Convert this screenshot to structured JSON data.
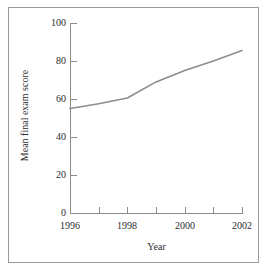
{
  "chart_data": {
    "type": "line",
    "title": "",
    "xlabel": "Year",
    "ylabel": "Mean final exam score",
    "x": [
      1996,
      1997,
      1998,
      1999,
      2000,
      2001,
      2002
    ],
    "series": [
      {
        "name": "Mean final exam score",
        "values": [
          55,
          57.5,
          60.5,
          69,
          75,
          80,
          85.5
        ],
        "color": "#8c8c8c"
      }
    ],
    "xlim": [
      1996,
      2002
    ],
    "ylim": [
      0,
      100
    ],
    "xticks": [
      1996,
      1997,
      1998,
      1999,
      2000,
      2001,
      2002
    ],
    "xtick_labels": [
      "1996",
      "",
      "1998",
      "",
      "2000",
      "",
      "2002"
    ],
    "yticks": [
      0,
      20,
      40,
      60,
      80,
      100
    ],
    "ytick_labels": [
      "0",
      "20",
      "40",
      "60",
      "80",
      "100"
    ],
    "grid": false,
    "legend": "none",
    "frame_color": "#9a9a9a",
    "axis_color": "#8c8c8c"
  }
}
